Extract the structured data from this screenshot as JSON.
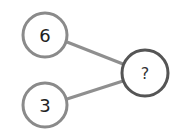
{
  "diagram": {
    "type": "number-bond",
    "parts": [
      {
        "label": "6",
        "cx": 45,
        "cy": 35,
        "r": 22
      },
      {
        "label": "3",
        "cx": 45,
        "cy": 105,
        "r": 22
      }
    ],
    "whole": {
      "label": "?",
      "cx": 145,
      "cy": 73,
      "r": 23
    },
    "colors": {
      "part_stroke": "#8a8a8a",
      "whole_stroke": "#555555",
      "connector": "#8f8f8f",
      "text": "#222222"
    }
  }
}
